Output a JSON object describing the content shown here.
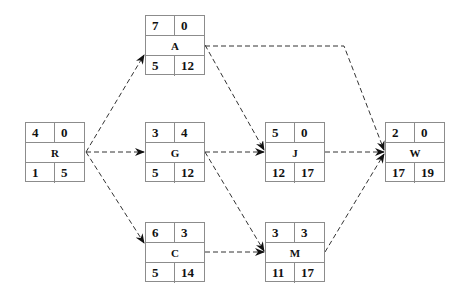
{
  "diagram": {
    "type": "activity-on-node network",
    "edge_style": "dashed arrow",
    "nodes": {
      "R": {
        "label": "R",
        "top_left": "4",
        "top_right": "0",
        "bottom_left": "1",
        "bottom_right": "5"
      },
      "A": {
        "label": "A",
        "top_left": "7",
        "top_right": "0",
        "bottom_left": "5",
        "bottom_right": "12"
      },
      "G": {
        "label": "G",
        "top_left": "3",
        "top_right": "4",
        "bottom_left": "5",
        "bottom_right": "12"
      },
      "C": {
        "label": "C",
        "top_left": "6",
        "top_right": "3",
        "bottom_left": "5",
        "bottom_right": "14"
      },
      "J": {
        "label": "J",
        "top_left": "5",
        "top_right": "0",
        "bottom_left": "12",
        "bottom_right": "17"
      },
      "M": {
        "label": "M",
        "top_left": "3",
        "top_right": "3",
        "bottom_left": "11",
        "bottom_right": "17"
      },
      "W": {
        "label": "W",
        "top_left": "2",
        "top_right": "0",
        "bottom_left": "17",
        "bottom_right": "19"
      }
    },
    "edges": [
      {
        "from": "R",
        "to": "A"
      },
      {
        "from": "R",
        "to": "G"
      },
      {
        "from": "R",
        "to": "C"
      },
      {
        "from": "A",
        "to": "J"
      },
      {
        "from": "A",
        "to": "W"
      },
      {
        "from": "G",
        "to": "J"
      },
      {
        "from": "G",
        "to": "M"
      },
      {
        "from": "C",
        "to": "M"
      },
      {
        "from": "J",
        "to": "W"
      },
      {
        "from": "M",
        "to": "W"
      }
    ],
    "colors": {
      "line": "#333333",
      "border": "#8c8c8c",
      "text": "#111111"
    }
  }
}
